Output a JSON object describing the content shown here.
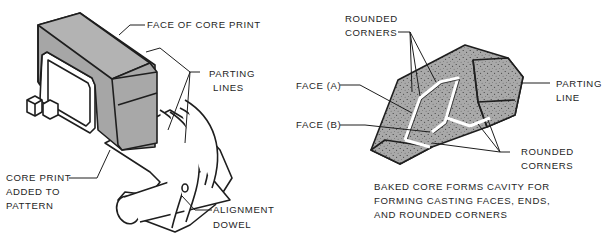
{
  "left_figure": {
    "title": "Pattern with core print",
    "labels": {
      "face_of_core_print": "FACE OF CORE PRINT",
      "parting_lines_1": "PARTING",
      "parting_lines_2": "LINES",
      "core_print_added_1": "CORE PRINT",
      "core_print_added_2": "ADDED TO",
      "core_print_added_3": "PATTERN",
      "alignment_dowel_1": "ALIGNMENT",
      "alignment_dowel_2": "DOWEL"
    }
  },
  "right_figure": {
    "title": "Baked core",
    "labels": {
      "rounded_corners_top_1": "ROUNDED",
      "rounded_corners_top_2": "CORNERS",
      "face_a": "FACE (A)",
      "face_b": "FACE (B)",
      "parting_line_1": "PARTING",
      "parting_line_2": "LINE",
      "rounded_corners_bottom_1": "ROUNDED",
      "rounded_corners_bottom_2": "CORNERS"
    },
    "caption": [
      "BAKED CORE FORMS CAVITY FOR",
      "FORMING CASTING FACES, ENDS,",
      "AND ROUNDED CORNERS"
    ]
  },
  "colors": {
    "ink": "#1e1e1e",
    "core_print_gray": "#a6a6a6",
    "core_print_top": "#b3b3b3",
    "sand_gray": "#a9a9a9",
    "background": "#ffffff"
  }
}
